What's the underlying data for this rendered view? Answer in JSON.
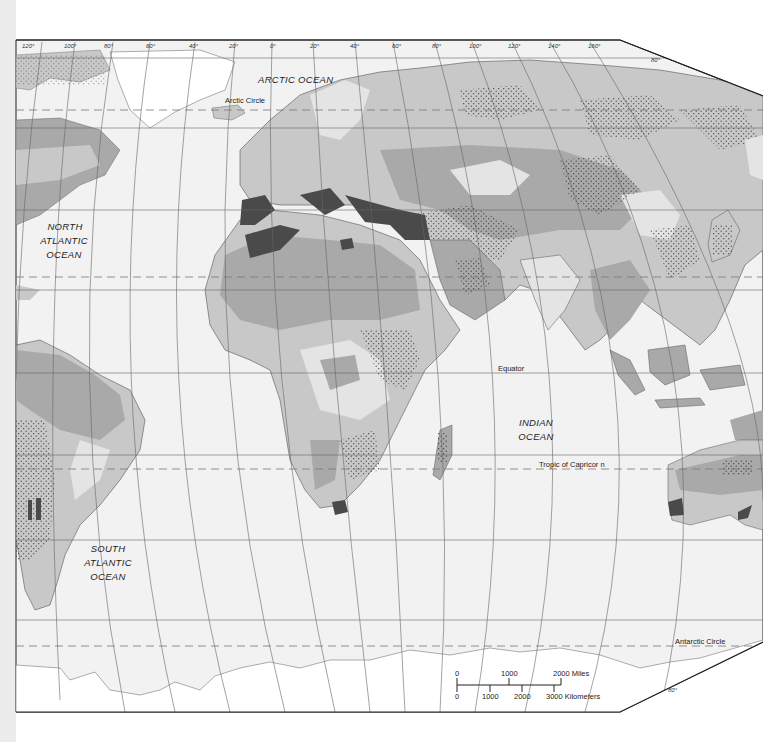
{
  "map": {
    "title": "World climate regions (Eastern Hemisphere & Atlantic)",
    "colors": {
      "ocean": "#f2f2f2",
      "land_light": "#e4e4e4",
      "land_mid": "#c8c8c8",
      "land_dark": "#a9a9a9",
      "mediterranean": "#4a4a4a",
      "ice": "#ffffff",
      "graticule": "#666666",
      "border": "#555555"
    },
    "longitude_labels": [
      "120°",
      "100°",
      "80°",
      "60°",
      "40°",
      "20°",
      "0°",
      "20°",
      "40°",
      "60°",
      "80°",
      "100°",
      "120°",
      "140°",
      "160°"
    ],
    "latitude_label_top": "80°",
    "latitude_label_bottom": "80°",
    "oceans": {
      "arctic": "ARCTIC   OCEAN",
      "north_atlantic": [
        "NORTH",
        "ATLANTIC",
        "OCEAN"
      ],
      "south_atlantic": [
        "SOUTH",
        "ATLANTIC",
        "OCEAN"
      ],
      "indian": [
        "INDIAN",
        "OCEAN"
      ]
    },
    "lines": {
      "arctic_circle": "Arctic Circle",
      "equator": "Equator",
      "tropic_capricorn": "Tropic of Capricor n",
      "antarctic_circle": "Antarctic Circle"
    },
    "scale_bar": {
      "miles_labels": [
        "0",
        "1000",
        "2000 Miles"
      ],
      "km_labels": [
        "0",
        "1000",
        "2000",
        "3000 Kilometers"
      ]
    }
  }
}
